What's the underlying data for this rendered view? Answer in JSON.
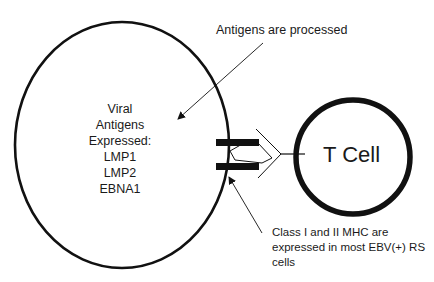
{
  "diagram": {
    "rs_cell": {
      "lines": [
        "Viral",
        "Antigens",
        "Expressed:",
        "LMP1",
        "LMP2",
        "EBNA1"
      ]
    },
    "t_cell": {
      "label": "T Cell"
    },
    "annotations": {
      "processed": "Antigens are processed",
      "mhc": "Class I and II MHC are expressed in most EBV(+) RS cells"
    },
    "colors": {
      "stroke": "#111111",
      "background": "#ffffff"
    }
  }
}
